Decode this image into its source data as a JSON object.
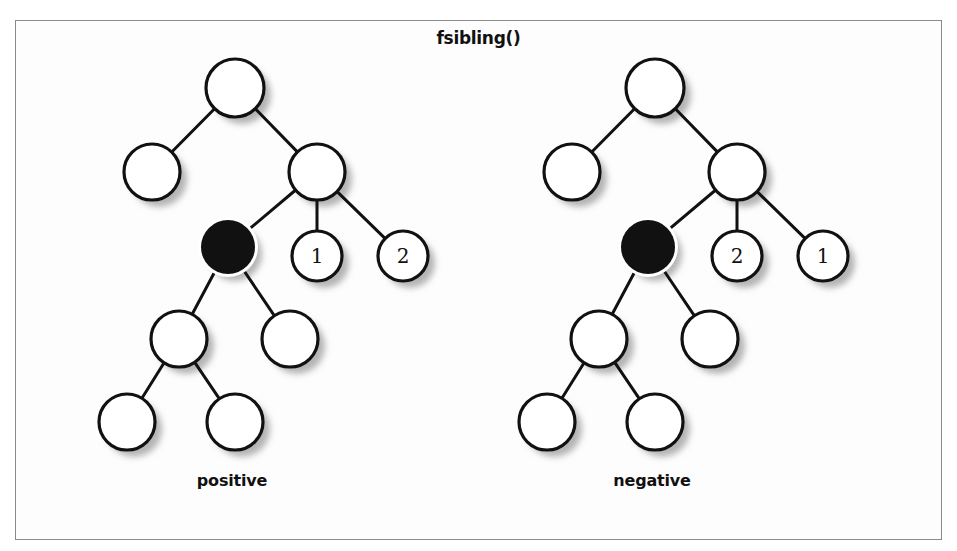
{
  "figure": {
    "title": "fsibling()",
    "background_color": "#fdfdfd",
    "frame_color": "#8a8a8a",
    "node_stroke_color": "#111111",
    "node_fill_color": "#ffffff",
    "highlight_fill_color": "#111111",
    "edge_color": "#111111",
    "shadow_color": "#b4b4b4"
  },
  "chart_data": {
    "type": "diagram",
    "title": "fsibling()",
    "trees": [
      {
        "name": "positive",
        "caption": "positive",
        "nodes": [
          {
            "id": "root",
            "cx": 235,
            "cy": 88,
            "r": 29,
            "fill": "white",
            "label": ""
          },
          {
            "id": "l1",
            "cx": 152,
            "cy": 172,
            "r": 28,
            "fill": "white",
            "label": ""
          },
          {
            "id": "r1",
            "cx": 317,
            "cy": 172,
            "r": 28,
            "fill": "white",
            "label": ""
          },
          {
            "id": "current",
            "cx": 228,
            "cy": 247,
            "r": 27,
            "fill": "black",
            "label": ""
          },
          {
            "id": "sib1",
            "cx": 317,
            "cy": 256,
            "r": 25,
            "fill": "white",
            "label": "1"
          },
          {
            "id": "sib2",
            "cx": 403,
            "cy": 256,
            "r": 25,
            "fill": "white",
            "label": "2"
          },
          {
            "id": "c1",
            "cx": 179,
            "cy": 339,
            "r": 28,
            "fill": "white",
            "label": ""
          },
          {
            "id": "c2",
            "cx": 290,
            "cy": 339,
            "r": 28,
            "fill": "white",
            "label": ""
          },
          {
            "id": "g1",
            "cx": 127,
            "cy": 422,
            "r": 28,
            "fill": "white",
            "label": ""
          },
          {
            "id": "g2",
            "cx": 235,
            "cy": 422,
            "r": 28,
            "fill": "white",
            "label": ""
          }
        ],
        "edges": [
          [
            "root",
            "l1"
          ],
          [
            "root",
            "r1"
          ],
          [
            "r1",
            "current"
          ],
          [
            "r1",
            "sib1"
          ],
          [
            "r1",
            "sib2"
          ],
          [
            "current",
            "c1"
          ],
          [
            "current",
            "c2"
          ],
          [
            "c1",
            "g1"
          ],
          [
            "c1",
            "g2"
          ]
        ]
      },
      {
        "name": "negative",
        "caption": "negative",
        "nodes": [
          {
            "id": "root",
            "cx": 655,
            "cy": 88,
            "r": 29,
            "fill": "white",
            "label": ""
          },
          {
            "id": "l1",
            "cx": 572,
            "cy": 172,
            "r": 28,
            "fill": "white",
            "label": ""
          },
          {
            "id": "r1",
            "cx": 737,
            "cy": 172,
            "r": 28,
            "fill": "white",
            "label": ""
          },
          {
            "id": "current",
            "cx": 648,
            "cy": 247,
            "r": 27,
            "fill": "black",
            "label": ""
          },
          {
            "id": "sib1",
            "cx": 737,
            "cy": 256,
            "r": 25,
            "fill": "white",
            "label": "2"
          },
          {
            "id": "sib2",
            "cx": 823,
            "cy": 256,
            "r": 25,
            "fill": "white",
            "label": "1"
          },
          {
            "id": "c1",
            "cx": 599,
            "cy": 339,
            "r": 28,
            "fill": "white",
            "label": ""
          },
          {
            "id": "c2",
            "cx": 710,
            "cy": 339,
            "r": 28,
            "fill": "white",
            "label": ""
          },
          {
            "id": "g1",
            "cx": 547,
            "cy": 422,
            "r": 28,
            "fill": "white",
            "label": ""
          },
          {
            "id": "g2",
            "cx": 655,
            "cy": 422,
            "r": 28,
            "fill": "white",
            "label": ""
          }
        ],
        "edges": [
          [
            "root",
            "l1"
          ],
          [
            "root",
            "r1"
          ],
          [
            "r1",
            "current"
          ],
          [
            "r1",
            "sib1"
          ],
          [
            "r1",
            "sib2"
          ],
          [
            "current",
            "c1"
          ],
          [
            "current",
            "c2"
          ],
          [
            "c1",
            "g1"
          ],
          [
            "c1",
            "g2"
          ]
        ]
      }
    ]
  }
}
